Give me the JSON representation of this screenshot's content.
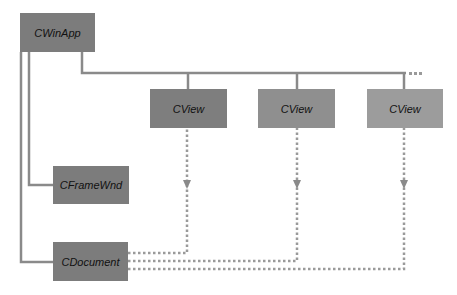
{
  "diagram": {
    "nodes": {
      "app": {
        "label": "CWinApp",
        "color": "#7c7c7c"
      },
      "view1": {
        "label": "CView",
        "color": "#7e7e7e"
      },
      "view2": {
        "label": "CView",
        "color": "#8f8f8f"
      },
      "view3": {
        "label": "CView",
        "color": "#9c9c9c"
      },
      "frame": {
        "label": "CFrameWnd",
        "color": "#7c7c7c"
      },
      "doc": {
        "label": "CDocument",
        "color": "#7c7c7c"
      }
    },
    "colors": {
      "solid_line": "#8a8a8a",
      "dotted_line": "#9a9a9a"
    },
    "edges": [
      {
        "from": "CWinApp",
        "to": "CView",
        "style": "solid"
      },
      {
        "from": "CWinApp",
        "to": "CView",
        "style": "solid"
      },
      {
        "from": "CWinApp",
        "to": "CView",
        "style": "solid"
      },
      {
        "from": "CWinApp",
        "to": "CFrameWnd",
        "style": "solid"
      },
      {
        "from": "CWinApp",
        "to": "CDocument",
        "style": "solid"
      },
      {
        "from": "CDocument",
        "to": "CView",
        "style": "dotted-arrow"
      },
      {
        "from": "CDocument",
        "to": "CView",
        "style": "dotted-arrow"
      },
      {
        "from": "CDocument",
        "to": "CView",
        "style": "dotted-arrow"
      }
    ]
  }
}
